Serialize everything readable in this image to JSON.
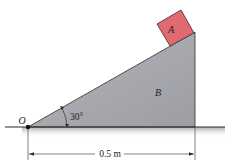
{
  "diagram": {
    "block_label": "A",
    "wedge_label": "B",
    "pivot_label": "O",
    "angle_label": "30°",
    "dimension_label": "0.5 m",
    "colors": {
      "block_fill": "#e06a6f",
      "block_stroke": "#3a2a2a",
      "wedge_fill": "#a6a8ad",
      "wedge_stroke": "#2b2b2b",
      "ground_line": "#2b2b2b",
      "ground_shadow": "#b9bbb5",
      "text": "#222222"
    }
  }
}
